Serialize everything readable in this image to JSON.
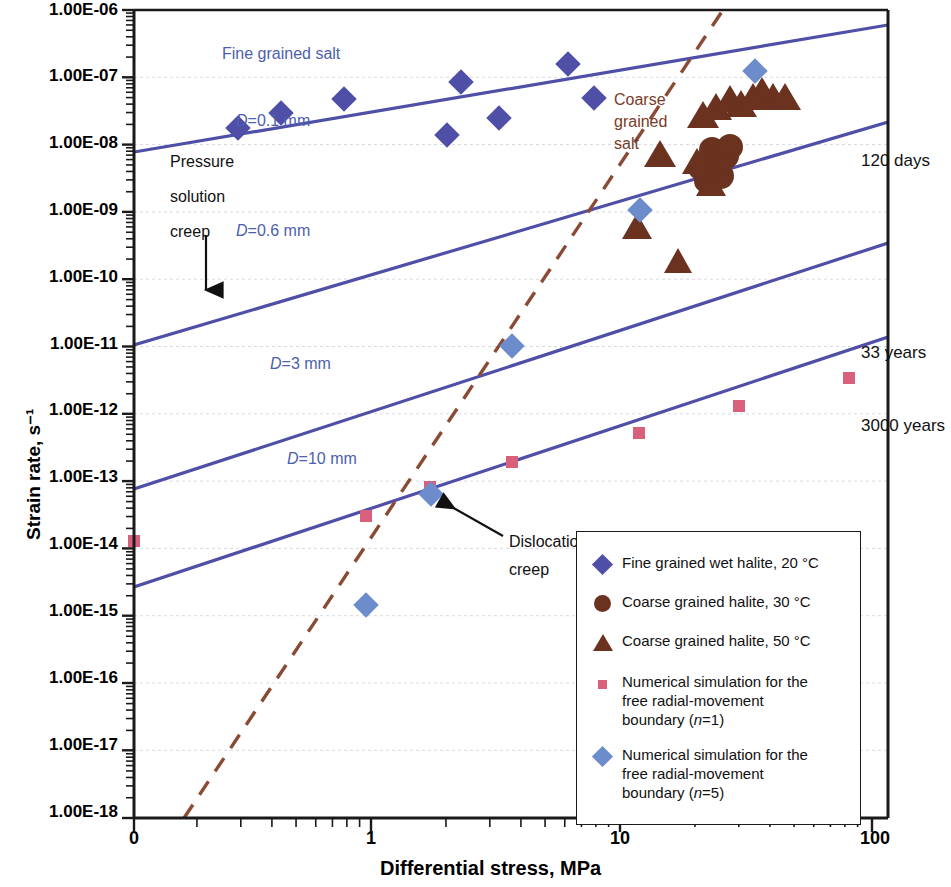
{
  "chart_data": {
    "type": "scatter",
    "title": "",
    "xlabel": "Differential stress, MPa",
    "ylabel": "Strain rate, s⁻¹",
    "xscale": "log",
    "yscale": "log",
    "xlim": [
      0.2,
      100
    ],
    "ylim": [
      1e-18,
      1e-06
    ],
    "xticks": [
      "0",
      "1",
      "10",
      "100"
    ],
    "xtick_values": [
      0.2,
      1,
      10,
      100
    ],
    "yticks": [
      "1.00E-06",
      "1.00E-07",
      "1.00E-08",
      "1.00E-09",
      "1.00E-10",
      "1.00E-11",
      "1.00E-12",
      "1.00E-13",
      "1.00E-14",
      "1.00E-15",
      "1.00E-16",
      "1.00E-17",
      "1.00E-18"
    ],
    "ytick_values": [
      1e-06,
      1e-07,
      1e-08,
      1e-09,
      1e-10,
      1e-11,
      1e-12,
      1e-13,
      1e-14,
      1e-15,
      1e-16,
      1e-17,
      1e-18
    ],
    "grid": "horizontal-minor",
    "legend_position": "bottom-right",
    "series": [
      {
        "name": "Fine grained wet halite, 20 °C",
        "marker": "diamond",
        "color": "#4f4fa8",
        "points": [
          {
            "x": 0.3,
            "y": 2e-08
          },
          {
            "x": 0.45,
            "y": 3.4e-08
          },
          {
            "x": 0.8,
            "y": 5.3e-08
          },
          {
            "x": 2.1,
            "y": 1.05e-07
          },
          {
            "x": 2.1,
            "y": 1.6e-08
          },
          {
            "x": 3.1,
            "y": 2.5e-08
          },
          {
            "x": 5.8,
            "y": 2.1e-07
          },
          {
            "x": 7.2,
            "y": 6.2e-08
          }
        ]
      },
      {
        "name": "Coarse grained halite, 30 °C",
        "marker": "circle",
        "color": "#6b3220",
        "points": [
          {
            "x": 23.5,
            "y": 1.15e-08
          },
          {
            "x": 24.0,
            "y": 8e-09
          },
          {
            "x": 24.5,
            "y": 6.4e-09
          },
          {
            "x": 25.5,
            "y": 5.5e-09
          },
          {
            "x": 26.0,
            "y": 7.6e-09
          },
          {
            "x": 26.5,
            "y": 1e-08
          },
          {
            "x": 27.5,
            "y": 1.35e-08
          },
          {
            "x": 25.0,
            "y": 9.2e-09
          },
          {
            "x": 23.0,
            "y": 5.2e-09
          }
        ]
      },
      {
        "name": "Coarse grained halite, 50 °C",
        "marker": "triangle",
        "color": "#6b3220",
        "points": [
          {
            "x": 13.0,
            "y": 9e-10
          },
          {
            "x": 13.5,
            "y": 9.5e-09
          },
          {
            "x": 16.5,
            "y": 3.7e-10
          },
          {
            "x": 20.0,
            "y": 7.5e-09
          },
          {
            "x": 22.0,
            "y": 4e-09
          },
          {
            "x": 23.5,
            "y": 2.4e-08
          },
          {
            "x": 24.5,
            "y": 3.2e-08
          },
          {
            "x": 25.5,
            "y": 4.3e-08
          },
          {
            "x": 26.5,
            "y": 3.6e-08
          },
          {
            "x": 28.0,
            "y": 4.6e-08
          },
          {
            "x": 29.0,
            "y": 5.6e-08
          },
          {
            "x": 30.5,
            "y": 4.6e-08
          },
          {
            "x": 32.0,
            "y": 4.6e-08
          }
        ]
      },
      {
        "name": "Numerical simulation for the free radial-movement boundary (n=1)",
        "marker": "small-square",
        "color": "#d9607a",
        "points": [
          {
            "x": 0.2,
            "y": 1.2e-14
          },
          {
            "x": 1.0,
            "y": 1.2e-13
          },
          {
            "x": 2.5,
            "y": 3e-13
          },
          {
            "x": 5.9,
            "y": 7.4e-13
          },
          {
            "x": 15.5,
            "y": 1.9e-12
          },
          {
            "x": 38.0,
            "y": 4.5e-12
          },
          {
            "x": 95.0,
            "y": 1.15e-11
          }
        ]
      },
      {
        "name": "Numerical simulation for the free radial-movement boundary (n=5)",
        "marker": "diamond-light",
        "color": "#6d8ccb",
        "points": [
          {
            "x": 1.0,
            "y": 1.5e-15
          },
          {
            "x": 2.5,
            "y": 1.3e-13
          },
          {
            "x": 5.9,
            "y": 1.25e-11
          },
          {
            "x": 15.5,
            "y": 1.2e-09
          },
          {
            "x": 37.0,
            "y": 1.25e-07
          }
        ]
      }
    ],
    "lines": [
      {
        "label": "D=0.1 mm",
        "style": "solid",
        "color": "#4f4fa8",
        "x1": 0.2,
        "y1": 6e-09,
        "x2": 100,
        "y2": 3.6e-07
      },
      {
        "label": "D=0.6 mm",
        "style": "solid",
        "color": "#4f4fa8",
        "x1": 0.2,
        "y1": 3e-11,
        "x2": 100,
        "y2": 1.9e-08
      },
      {
        "label": "D=3 mm",
        "style": "solid",
        "color": "#4f4fa8",
        "x1": 0.2,
        "y1": 4.4e-13,
        "x2": 100,
        "y2": 4.6e-10
      },
      {
        "label": "D=10 mm",
        "style": "solid",
        "color": "#4f4fa8",
        "x1": 0.2,
        "y1": 1.2e-14,
        "x2": 100,
        "y2": 1.2e-11
      },
      {
        "label": "Dislocation creep",
        "style": "dashed",
        "color": "#8a4a33",
        "x1": 0.9,
        "y1": 1e-18,
        "x2": 30,
        "y2": 1e-06
      }
    ],
    "annotations": [
      {
        "text": "Fine grained salt",
        "color": "#4d5fae"
      },
      {
        "text": "Coarse grained salt",
        "color": "#7a3b28"
      },
      {
        "text": "Pressure solution creep",
        "color": "#111111",
        "arrow": "down"
      },
      {
        "text": "Dislocation creep",
        "color": "#111111",
        "arrow": "up-left"
      },
      {
        "text": "120 days",
        "color": "#111111"
      },
      {
        "text": "33   years",
        "color": "#111111"
      },
      {
        "text": "3000 years",
        "color": "#111111"
      }
    ]
  },
  "axes": {
    "ylabel": "Strain rate, s⁻¹",
    "xlabel": "Differential stress, MPa",
    "yticks": [
      "1.00E-06",
      "1.00E-07",
      "1.00E-08",
      "1.00E-09",
      "1.00E-10",
      "1.00E-11",
      "1.00E-12",
      "1.00E-13",
      "1.00E-14",
      "1.00E-15",
      "1.00E-16",
      "1.00E-17",
      "1.00E-18"
    ],
    "xticks": [
      "0",
      "1",
      "10",
      "100"
    ]
  },
  "line_labels": {
    "d01": "=0.1 mm",
    "d06": "=0.6 mm",
    "d3": "=3 mm",
    "d10": "=10 mm",
    "d_sym": "D"
  },
  "annotations": {
    "fine_grained_salt": "Fine grained salt",
    "coarse_grained_salt_l1": "Coarse",
    "coarse_grained_salt_l2": "grained",
    "coarse_grained_salt_l3": "salt",
    "pressure_l1": "Pressure",
    "pressure_l2": "solution",
    "pressure_l3": "creep",
    "dislocation_l1": "Dislocation",
    "dislocation_l2": "creep",
    "time_120_days": "120 days",
    "time_33_years": "33   years",
    "time_3000_years": "3000 years"
  },
  "legend": {
    "items": [
      {
        "label": "Fine grained wet halite, 20 °C",
        "marker": "diamond-dark",
        "color": "#4f4fa8"
      },
      {
        "label": "Coarse grained halite, 30 °C",
        "marker": "circle",
        "color": "#6b3220"
      },
      {
        "label": "Coarse grained halite, 50 °C",
        "marker": "triangle",
        "color": "#6b3220"
      },
      {
        "label": "Numerical simulation for the",
        "label2": "free radial-movement",
        "label3a": "boundary (",
        "label3b": "n",
        "label3c": "=1)",
        "marker": "small-square",
        "color": "#d9607a"
      },
      {
        "label": "Numerical simulation for the",
        "label2": "free radial-movement",
        "label3a": "boundary (",
        "label3b": "n",
        "label3c": "=5)",
        "marker": "diamond-light",
        "color": "#6d8ccb"
      }
    ]
  }
}
